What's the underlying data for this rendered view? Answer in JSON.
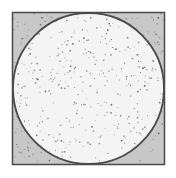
{
  "diagram": {
    "title": "",
    "colors": {
      "background": "#ffffff",
      "square_fill": "#c8c8c8",
      "circle_fill": "#f4f4f4",
      "outline": "#4a4a4a",
      "dot_dark": "#555555",
      "dot_light": "#8a8a8a"
    },
    "shapes": [
      {
        "name": "square",
        "kind": "square"
      },
      {
        "name": "inscribed-circle",
        "kind": "circle",
        "inscribed_in": "square"
      }
    ],
    "points": {
      "count": 420,
      "distribution": "uniform",
      "seed": 7
    }
  }
}
